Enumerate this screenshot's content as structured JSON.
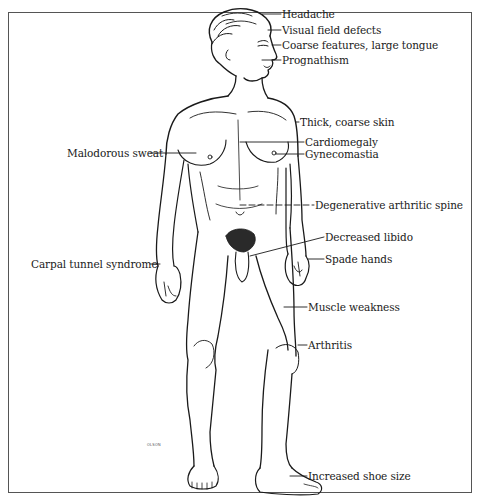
{
  "diagram": {
    "artist_signature": "OLSON",
    "labels_right": [
      {
        "text": "Headache",
        "x": 282,
        "y": 7
      },
      {
        "text": "Visual field defects",
        "x": 282,
        "y": 23
      },
      {
        "text": "Coarse features, large tongue",
        "x": 282,
        "y": 39
      },
      {
        "text": "Prognathism",
        "x": 282,
        "y": 54
      },
      {
        "text": "Thick, coarse skin",
        "x": 300,
        "y": 115
      },
      {
        "text": "Cardiomegaly",
        "x": 305,
        "y": 137
      },
      {
        "text": "Gynecomastia",
        "x": 305,
        "y": 149
      },
      {
        "text": "Degenerative arthritic spine",
        "x": 315,
        "y": 198
      },
      {
        "text": "Decreased libido",
        "x": 325,
        "y": 231
      },
      {
        "text": "Spade hands",
        "x": 325,
        "y": 253
      },
      {
        "text": "Muscle weakness",
        "x": 308,
        "y": 302
      },
      {
        "text": "Arthritis",
        "x": 308,
        "y": 339
      },
      {
        "text": "Increased shoe size",
        "x": 308,
        "y": 472
      }
    ],
    "labels_left": [
      {
        "text": "Malodorous sweat",
        "x": 68,
        "y": 147
      },
      {
        "text": "Carpal tunnel syndrome",
        "x": 32,
        "y": 258
      }
    ]
  },
  "colors": {
    "ink": "#1a1a1a",
    "border": "#555555",
    "background": "#ffffff"
  }
}
